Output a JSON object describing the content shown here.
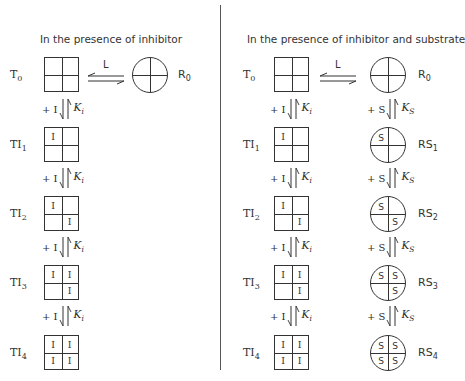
{
  "panels": {
    "left": {
      "title": "In the presence of inhibitor",
      "t0_label": "T",
      "t0_sub": "0",
      "r0_label": "R",
      "r0_sub": "0",
      "equilibrium_label": "L",
      "step": {
        "reagent": "+ I",
        "constant": "K",
        "constant_sub": "i"
      },
      "t_states": [
        {
          "label": "TI",
          "sub": "1",
          "cells": [
            "I",
            "",
            "",
            ""
          ]
        },
        {
          "label": "TI",
          "sub": "2",
          "cells": [
            "I",
            "",
            "",
            "I"
          ]
        },
        {
          "label": "TI",
          "sub": "3",
          "cells": [
            "I",
            "I",
            "",
            "I"
          ]
        },
        {
          "label": "TI",
          "sub": "4",
          "cells": [
            "I",
            "I",
            "I",
            "I"
          ]
        }
      ]
    },
    "right": {
      "title": "In the presence of inhibitor and substrate",
      "t0_label": "T",
      "t0_sub": "0",
      "r0_label": "R",
      "r0_sub": "0",
      "equilibrium_label": "L",
      "t_step": {
        "reagent": "+ I",
        "constant": "K",
        "constant_sub": "i"
      },
      "r_step": {
        "reagent": "+ S",
        "constant": "K",
        "constant_sub": "S"
      },
      "t_states": [
        {
          "label": "TI",
          "sub": "1",
          "cells": [
            "I",
            "",
            "",
            ""
          ]
        },
        {
          "label": "TI",
          "sub": "2",
          "cells": [
            "I",
            "",
            "",
            "I"
          ]
        },
        {
          "label": "TI",
          "sub": "3",
          "cells": [
            "I",
            "I",
            "",
            "I"
          ]
        },
        {
          "label": "TI",
          "sub": "4",
          "cells": [
            "I",
            "I",
            "I",
            "I"
          ]
        }
      ],
      "r_states": [
        {
          "label": "RS",
          "sub": "1",
          "cells": [
            "S",
            "",
            "",
            ""
          ]
        },
        {
          "label": "RS",
          "sub": "2",
          "cells": [
            "S",
            "",
            "",
            "S"
          ]
        },
        {
          "label": "RS",
          "sub": "3",
          "cells": [
            "S",
            "S",
            "",
            "S"
          ]
        },
        {
          "label": "RS",
          "sub": "4",
          "cells": [
            "S",
            "S",
            "S",
            "S"
          ]
        }
      ]
    }
  }
}
